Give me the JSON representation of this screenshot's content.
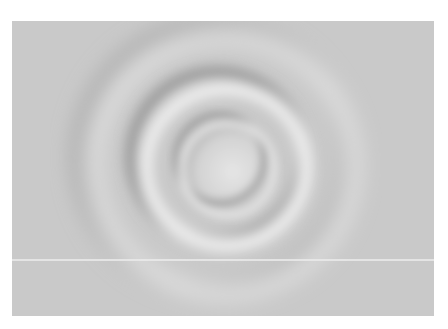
{
  "image": {
    "subject": "Concentric water ripples on a grey surface",
    "colors": {
      "background": "#c9c9c9",
      "highlight": "#e8e8e8",
      "shadow": "#9e9e9e",
      "page": "#ffffff"
    },
    "ripple_center": [
      212,
      142
    ],
    "ring_radii": [
      42,
      80,
      130
    ]
  }
}
